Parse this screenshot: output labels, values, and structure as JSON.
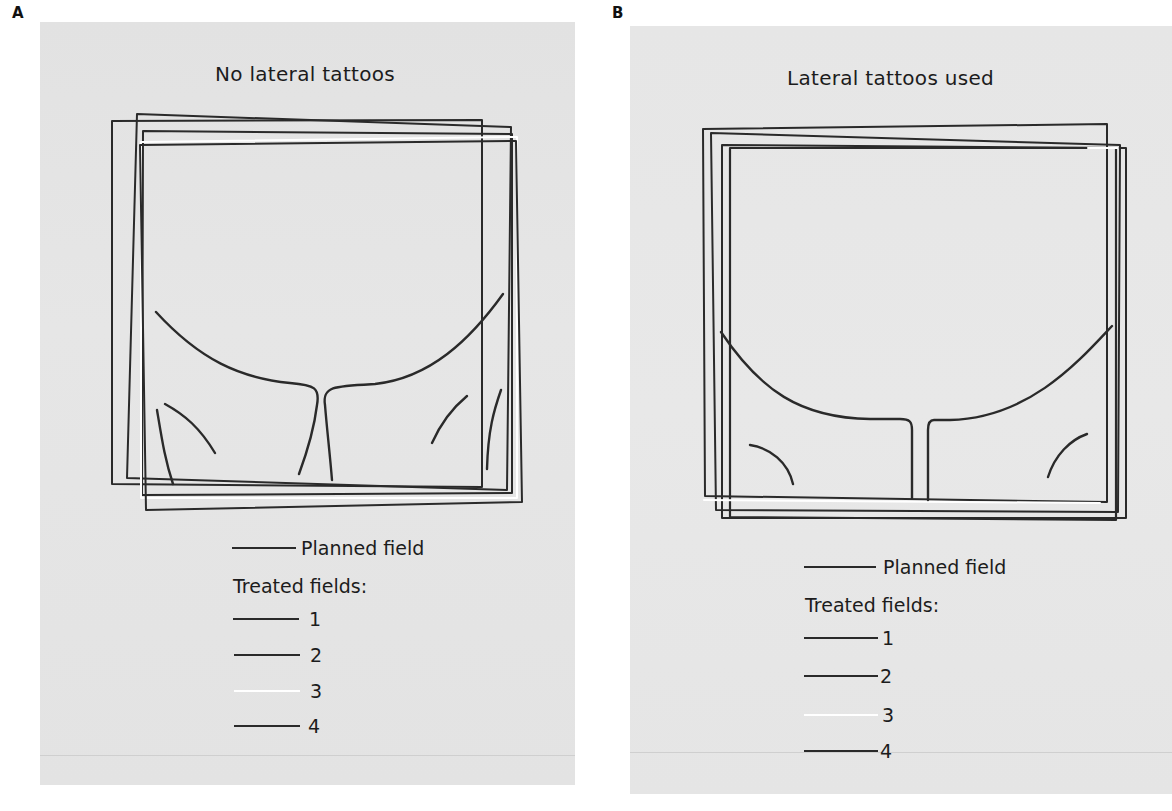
{
  "panels": [
    {
      "letter": "A",
      "title": "No lateral tattoos",
      "legend": {
        "planned_label": "Planned field",
        "treated_heading": "Treated fields:",
        "treated_items": [
          {
            "label": "1",
            "color": "#2a2a2a"
          },
          {
            "label": "2",
            "color": "#2a2a2a"
          },
          {
            "label": "3",
            "color": "#ffffff"
          },
          {
            "label": "4",
            "color": "#2a2a2a"
          }
        ]
      }
    },
    {
      "letter": "B",
      "title": "Lateral tattoos used",
      "legend": {
        "planned_label": "Planned field",
        "treated_heading": "Treated fields:",
        "treated_items": [
          {
            "label": "1",
            "color": "#2a2a2a"
          },
          {
            "label": "2",
            "color": "#2a2a2a"
          },
          {
            "label": "3",
            "color": "#ffffff"
          },
          {
            "label": "4",
            "color": "#2a2a2a"
          }
        ]
      }
    }
  ],
  "colors": {
    "panel_background": "#e4e4e4",
    "line_dark": "#2a2a2a",
    "line_white": "#ffffff"
  }
}
